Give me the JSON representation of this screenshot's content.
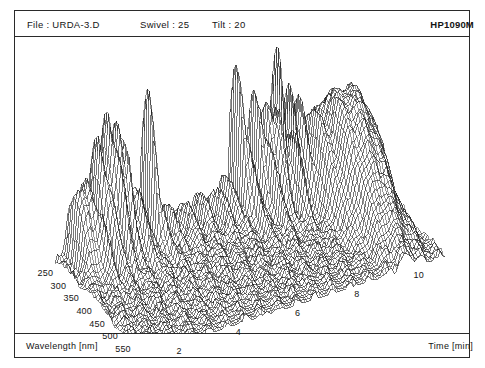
{
  "header": {
    "file_label": "File : URDA-3.D",
    "swivel_label": "Swivel : 25",
    "tilt_label": "Tilt : 20",
    "model_label": "HP1090M"
  },
  "footer": {
    "left_axis_label": "Wavelength [nm]",
    "right_axis_label": "Time [min]"
  },
  "colors": {
    "ink": "#141414",
    "frame": "#2a2a2a",
    "mesh": "#1a1a1a",
    "background": "#ffffff"
  },
  "chart_data": {
    "type": "line",
    "title": "URDA-3.D",
    "subtype": "3d-wireframe-mesh-surface",
    "xlabel": "Time [min]",
    "ylabel": "Wavelength [nm]",
    "zlabel": "Absorbance",
    "grid": true,
    "legend": false,
    "projection": {
      "swivel_deg": 25,
      "tilt_deg": 20
    },
    "x_ticks": [
      2,
      4,
      6,
      8,
      10
    ],
    "y_ticks": [
      250,
      300,
      350,
      400,
      450,
      500,
      550
    ],
    "xlim": [
      1.0,
      11.2
    ],
    "ylim": [
      230,
      570
    ],
    "zlim": [
      0,
      1.0
    ],
    "x_grid_lines": 120,
    "y_grid_lines": 46,
    "baseline_ripple": 0.035,
    "peaks": [
      {
        "time": 1.45,
        "wavelength": 258,
        "height": 0.33,
        "time_width": 0.085,
        "wl_width": 34
      },
      {
        "time": 1.62,
        "wavelength": 272,
        "height": 0.27,
        "time_width": 0.075,
        "wl_width": 30
      },
      {
        "time": 1.8,
        "wavelength": 262,
        "height": 0.4,
        "time_width": 0.08,
        "wl_width": 32
      },
      {
        "time": 1.95,
        "wavelength": 300,
        "height": 0.22,
        "time_width": 0.07,
        "wl_width": 40
      },
      {
        "time": 2.18,
        "wavelength": 256,
        "height": 0.58,
        "time_width": 0.075,
        "wl_width": 30
      },
      {
        "time": 2.34,
        "wavelength": 286,
        "height": 0.36,
        "time_width": 0.07,
        "wl_width": 36
      },
      {
        "time": 2.52,
        "wavelength": 254,
        "height": 0.72,
        "time_width": 0.07,
        "wl_width": 28
      },
      {
        "time": 2.66,
        "wavelength": 292,
        "height": 0.44,
        "time_width": 0.065,
        "wl_width": 34
      },
      {
        "time": 2.82,
        "wavelength": 260,
        "height": 0.63,
        "time_width": 0.068,
        "wl_width": 30
      },
      {
        "time": 2.98,
        "wavelength": 276,
        "height": 0.52,
        "time_width": 0.065,
        "wl_width": 32
      },
      {
        "time": 3.16,
        "wavelength": 252,
        "height": 0.46,
        "time_width": 0.07,
        "wl_width": 29
      },
      {
        "time": 3.35,
        "wavelength": 288,
        "height": 0.3,
        "time_width": 0.075,
        "wl_width": 38
      },
      {
        "time": 3.58,
        "wavelength": 266,
        "height": 0.26,
        "time_width": 0.08,
        "wl_width": 34
      },
      {
        "time": 3.95,
        "wavelength": 254,
        "height": 0.97,
        "time_width": 0.05,
        "wl_width": 24
      },
      {
        "time": 4.1,
        "wavelength": 280,
        "height": 0.21,
        "time_width": 0.07,
        "wl_width": 36
      },
      {
        "time": 4.55,
        "wavelength": 262,
        "height": 0.14,
        "time_width": 0.09,
        "wl_width": 40
      },
      {
        "time": 5.1,
        "wavelength": 270,
        "height": 0.12,
        "time_width": 0.11,
        "wl_width": 44
      },
      {
        "time": 5.7,
        "wavelength": 258,
        "height": 0.13,
        "time_width": 0.1,
        "wl_width": 38
      },
      {
        "time": 6.2,
        "wavelength": 266,
        "height": 0.15,
        "time_width": 0.095,
        "wl_width": 40
      },
      {
        "time": 6.62,
        "wavelength": 256,
        "height": 0.2,
        "time_width": 0.085,
        "wl_width": 34
      },
      {
        "time": 6.95,
        "wavelength": 252,
        "height": 0.88,
        "time_width": 0.055,
        "wl_width": 26
      },
      {
        "time": 7.1,
        "wavelength": 284,
        "height": 0.34,
        "time_width": 0.06,
        "wl_width": 34
      },
      {
        "time": 7.28,
        "wavelength": 262,
        "height": 0.3,
        "time_width": 0.065,
        "wl_width": 32
      },
      {
        "time": 7.55,
        "wavelength": 254,
        "height": 0.7,
        "time_width": 0.055,
        "wl_width": 27
      },
      {
        "time": 7.72,
        "wavelength": 290,
        "height": 0.42,
        "time_width": 0.06,
        "wl_width": 36
      },
      {
        "time": 7.9,
        "wavelength": 258,
        "height": 0.66,
        "time_width": 0.055,
        "wl_width": 28
      },
      {
        "time": 8.08,
        "wavelength": 276,
        "height": 0.55,
        "time_width": 0.058,
        "wl_width": 33
      },
      {
        "time": 8.28,
        "wavelength": 256,
        "height": 0.74,
        "time_width": 0.052,
        "wl_width": 26
      },
      {
        "time": 8.45,
        "wavelength": 296,
        "height": 0.38,
        "time_width": 0.062,
        "wl_width": 38
      },
      {
        "time": 8.64,
        "wavelength": 262,
        "height": 0.58,
        "time_width": 0.055,
        "wl_width": 30
      },
      {
        "time": 8.86,
        "wavelength": 272,
        "height": 0.47,
        "time_width": 0.06,
        "wl_width": 34
      },
      {
        "time": 9.15,
        "wavelength": 300,
        "height": 0.4,
        "time_width": 0.14,
        "wl_width": 70
      },
      {
        "time": 9.55,
        "wavelength": 330,
        "height": 0.44,
        "time_width": 0.18,
        "wl_width": 95
      },
      {
        "time": 9.95,
        "wavelength": 340,
        "height": 0.46,
        "time_width": 0.2,
        "wl_width": 110
      },
      {
        "time": 10.35,
        "wavelength": 330,
        "height": 0.42,
        "time_width": 0.19,
        "wl_width": 100
      },
      {
        "time": 10.7,
        "wavelength": 310,
        "height": 0.34,
        "time_width": 0.17,
        "wl_width": 90
      }
    ]
  }
}
